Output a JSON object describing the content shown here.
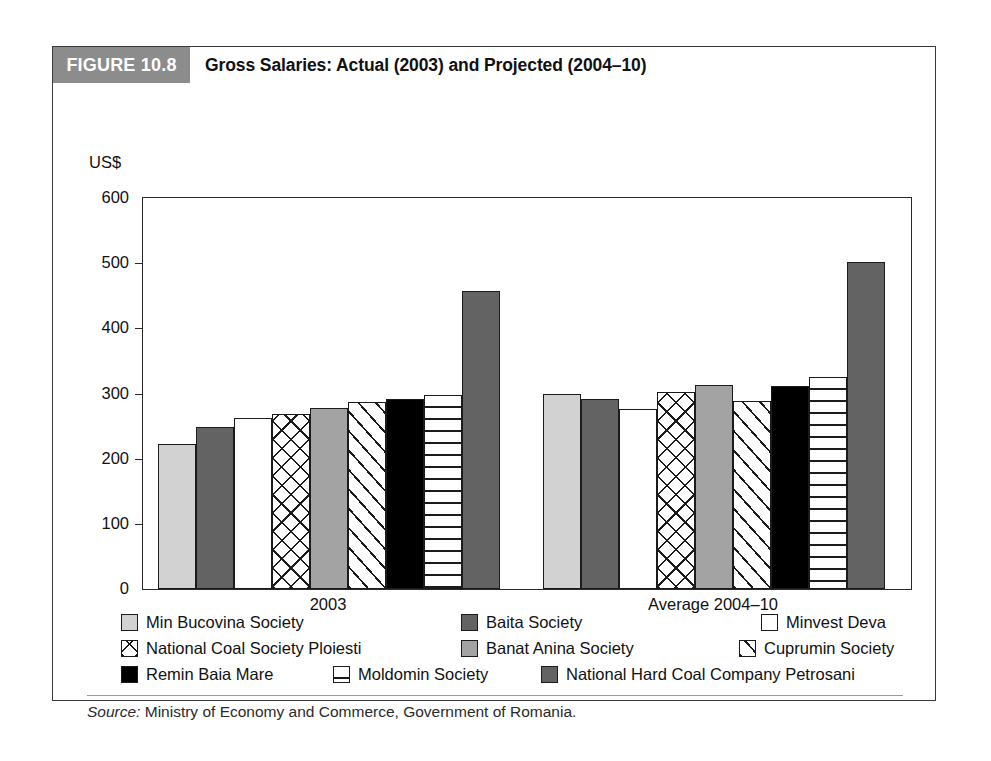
{
  "figure": {
    "number_label": "FIGURE 10.8",
    "title": "Gross Salaries: Actual (2003) and Projected (2004–10)",
    "number_badge_color": "#8c8c8c"
  },
  "source": {
    "prefix": "Source:",
    "text": " Ministry of Economy and Commerce, Government of Romania."
  },
  "chart_data": {
    "type": "bar",
    "title": "Gross Salaries: Actual (2003) and Projected (2004–10)",
    "xlabel": "",
    "ylabel": "US$",
    "ylim": [
      0,
      600
    ],
    "yticks": [
      0,
      100,
      200,
      300,
      400,
      500,
      600
    ],
    "ytick_labels": [
      "0",
      "100",
      "200",
      "300",
      "400",
      "500",
      "600"
    ],
    "grid": false,
    "legend_position": "below",
    "categories": [
      "2003",
      "Average 2004–10"
    ],
    "series": [
      {
        "name": "Min Bucovina Society",
        "pattern": "solid-light-gray",
        "color": "#d2d2d2",
        "values": [
          222,
          300
        ]
      },
      {
        "name": "Baita Society",
        "pattern": "solid-dark-gray",
        "color": "#636363",
        "values": [
          248,
          292
        ]
      },
      {
        "name": "Minvest Deva",
        "pattern": "solid-white",
        "color": "#ffffff",
        "values": [
          262,
          276
        ]
      },
      {
        "name": "National Coal Society Ploiesti",
        "pattern": "cross-hatch",
        "color": "#ffffff",
        "values": [
          268,
          303
        ]
      },
      {
        "name": "Banat Anina Society",
        "pattern": "solid-mid-gray",
        "color": "#a3a3a3",
        "values": [
          278,
          313
        ]
      },
      {
        "name": "Cuprumin Society",
        "pattern": "diagonal-stripe",
        "color": "#ffffff",
        "values": [
          287,
          288
        ]
      },
      {
        "name": "Remin Baia Mare",
        "pattern": "solid-black",
        "color": "#000000",
        "values": [
          291,
          312
        ]
      },
      {
        "name": "Moldomin Society",
        "pattern": "horizontal-line",
        "color": "#ffffff",
        "values": [
          298,
          325
        ]
      },
      {
        "name": "National Hard Coal Company Petrosani",
        "pattern": "solid-dark-gray",
        "color": "#636363",
        "values": [
          457,
          502
        ]
      }
    ]
  },
  "legend": {
    "rows": [
      [
        {
          "label": "Min Bucovina Society",
          "swatch": "solid-light-gray"
        },
        {
          "label": "Baita Society",
          "swatch": "solid-dark-gray"
        },
        {
          "label": "Minvest Deva",
          "swatch": "solid-white"
        }
      ],
      [
        {
          "label": "National Coal Society Ploiesti",
          "swatch": "cross-hatch"
        },
        {
          "label": "Banat Anina Society",
          "swatch": "solid-mid-gray"
        },
        {
          "label": "Cuprumin Society",
          "swatch": "diagonal-stripe"
        }
      ],
      [
        {
          "label": "Remin Baia Mare",
          "swatch": "solid-black"
        },
        {
          "label": "Moldomin Society",
          "swatch": "horizontal-line"
        },
        {
          "label": "National Hard Coal Company Petrosani",
          "swatch": "solid-dark-gray"
        }
      ]
    ]
  }
}
